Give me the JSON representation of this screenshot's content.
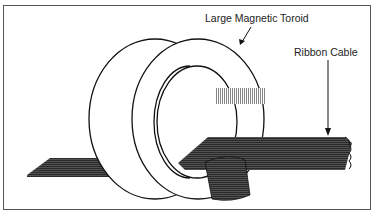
{
  "diagram": {
    "labels": {
      "toroid": "Large Magnetic Toroid",
      "cable": "Ribbon Cable"
    },
    "colors": {
      "line": "#111111",
      "cable": "#2a2a2a",
      "background": "#ffffff",
      "border": "#555555"
    }
  }
}
